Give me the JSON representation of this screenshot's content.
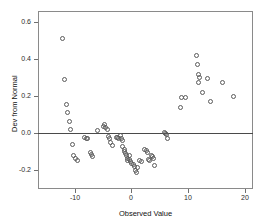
{
  "chart_data": {
    "type": "scatter",
    "title": "",
    "xlabel": "Observed Value",
    "ylabel": "Dev from Normal",
    "xlim": [
      -16.5,
      21.5
    ],
    "ylim": [
      -0.3,
      0.66
    ],
    "xticks": [
      -10,
      0,
      10,
      20
    ],
    "xtick_labels": [
      "-10",
      "0",
      "10",
      "20"
    ],
    "yticks": [
      -0.2,
      0.0,
      0.2,
      0.4,
      0.6
    ],
    "ytick_labels": [
      "-0.2",
      "0.0",
      "0.2",
      "0.4",
      "0.6"
    ],
    "grid": false,
    "legend": "none",
    "reference_line": {
      "y": 0.0,
      "style": "solid",
      "color": "#4a4a4a"
    },
    "marker": {
      "shape": "open-circle",
      "size": 5,
      "color": "#5b5b5b"
    },
    "points": [
      {
        "x": -12.2,
        "y": 0.51
      },
      {
        "x": -11.8,
        "y": 0.288
      },
      {
        "x": -11.5,
        "y": 0.155
      },
      {
        "x": -11.2,
        "y": 0.112
      },
      {
        "x": -11.0,
        "y": 0.063
      },
      {
        "x": -10.8,
        "y": 0.022
      },
      {
        "x": -10.4,
        "y": -0.06
      },
      {
        "x": -10.2,
        "y": -0.118
      },
      {
        "x": -9.9,
        "y": -0.133
      },
      {
        "x": -9.6,
        "y": -0.148
      },
      {
        "x": -8.2,
        "y": -0.022
      },
      {
        "x": -8.0,
        "y": -0.028
      },
      {
        "x": -7.8,
        "y": -0.03
      },
      {
        "x": -7.3,
        "y": -0.105
      },
      {
        "x": -7.0,
        "y": -0.112
      },
      {
        "x": -6.8,
        "y": -0.125
      },
      {
        "x": -6.0,
        "y": 0.016
      },
      {
        "x": -4.9,
        "y": 0.038
      },
      {
        "x": -4.7,
        "y": 0.046
      },
      {
        "x": -4.5,
        "y": 0.03
      },
      {
        "x": -4.3,
        "y": 0.022
      },
      {
        "x": -4.1,
        "y": -0.018
      },
      {
        "x": -3.9,
        "y": -0.028
      },
      {
        "x": -3.6,
        "y": -0.05
      },
      {
        "x": -3.3,
        "y": -0.063
      },
      {
        "x": -2.6,
        "y": -0.02
      },
      {
        "x": -2.4,
        "y": -0.022
      },
      {
        "x": -2.2,
        "y": -0.026
      },
      {
        "x": -2.0,
        "y": -0.01
      },
      {
        "x": -1.8,
        "y": -0.03
      },
      {
        "x": -1.6,
        "y": -0.038
      },
      {
        "x": -1.5,
        "y": -0.072
      },
      {
        "x": -1.3,
        "y": -0.085
      },
      {
        "x": -1.2,
        "y": -0.098
      },
      {
        "x": -1.0,
        "y": -0.11
      },
      {
        "x": -0.9,
        "y": -0.122
      },
      {
        "x": -0.7,
        "y": -0.135
      },
      {
        "x": -0.6,
        "y": -0.148
      },
      {
        "x": -0.4,
        "y": -0.12
      },
      {
        "x": -0.3,
        "y": -0.142
      },
      {
        "x": -0.1,
        "y": -0.152
      },
      {
        "x": 0.1,
        "y": -0.16
      },
      {
        "x": 0.3,
        "y": -0.168
      },
      {
        "x": 0.5,
        "y": -0.178
      },
      {
        "x": 0.7,
        "y": -0.2
      },
      {
        "x": 0.9,
        "y": -0.21
      },
      {
        "x": 1.1,
        "y": -0.182
      },
      {
        "x": 1.5,
        "y": -0.148
      },
      {
        "x": 1.8,
        "y": -0.152
      },
      {
        "x": 2.4,
        "y": -0.088
      },
      {
        "x": 2.6,
        "y": -0.095
      },
      {
        "x": 2.8,
        "y": -0.105
      },
      {
        "x": 3.0,
        "y": -0.14
      },
      {
        "x": 3.2,
        "y": -0.148
      },
      {
        "x": 3.5,
        "y": -0.118
      },
      {
        "x": 3.7,
        "y": -0.126
      },
      {
        "x": 3.9,
        "y": -0.133
      },
      {
        "x": 4.1,
        "y": -0.172
      },
      {
        "x": 5.9,
        "y": 0.004
      },
      {
        "x": 6.1,
        "y": -0.002
      },
      {
        "x": 6.2,
        "y": -0.008
      },
      {
        "x": 6.3,
        "y": -0.03
      },
      {
        "x": 8.6,
        "y": 0.142
      },
      {
        "x": 8.9,
        "y": 0.192
      },
      {
        "x": 9.5,
        "y": 0.194
      },
      {
        "x": 11.6,
        "y": 0.418
      },
      {
        "x": 11.7,
        "y": 0.372
      },
      {
        "x": 11.8,
        "y": 0.32
      },
      {
        "x": 11.9,
        "y": 0.274
      },
      {
        "x": 12.1,
        "y": 0.3
      },
      {
        "x": 12.6,
        "y": 0.222
      },
      {
        "x": 13.4,
        "y": 0.294
      },
      {
        "x": 14.0,
        "y": 0.174
      },
      {
        "x": 16.1,
        "y": 0.274
      },
      {
        "x": 18.0,
        "y": 0.198
      }
    ]
  },
  "axes": {
    "y_title": "Dev from Normal",
    "x_title": "Observed Value"
  }
}
